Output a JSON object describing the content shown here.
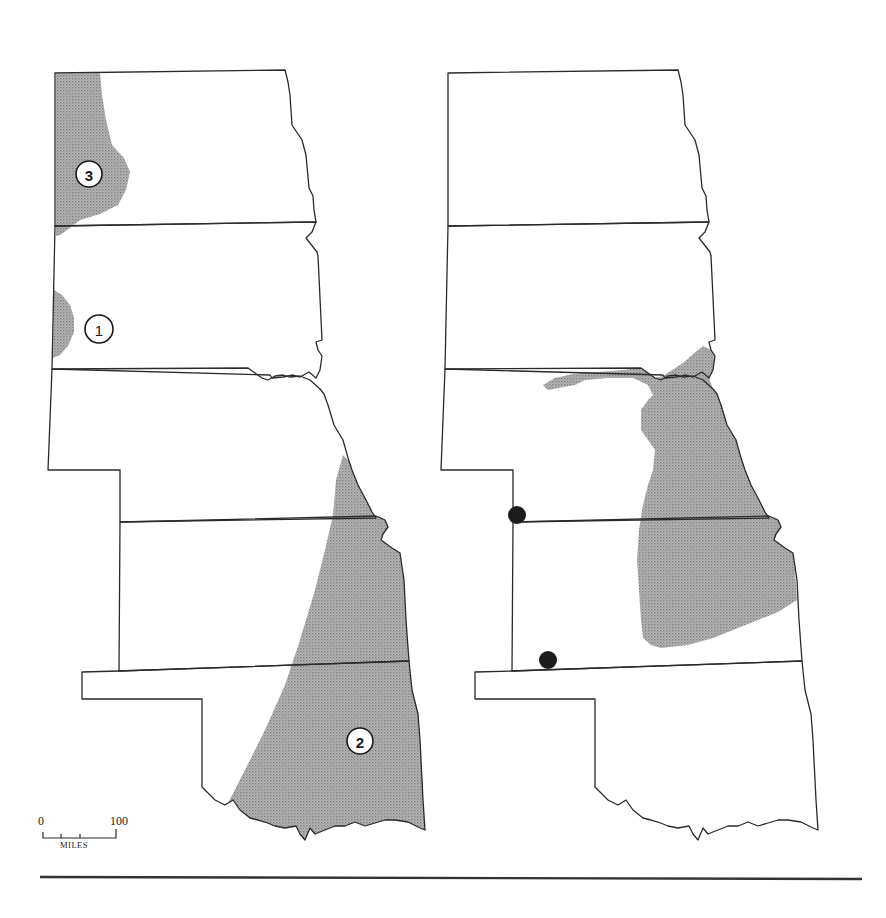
{
  "figure": {
    "type": "distribution-map-pair",
    "region": "Great Plains (North Dakota, South Dakota, Nebraska, Kansas, Oklahoma)",
    "colors": {
      "outline": "#2a2a2a",
      "range_fill": "#a8a8a8",
      "locality_dot": "#1c1c1c",
      "background": "#ffffff"
    }
  },
  "left_map": {
    "states": [
      "North Dakota",
      "South Dakota",
      "Nebraska",
      "Kansas",
      "Oklahoma"
    ],
    "ranges": [
      {
        "id": "1",
        "label": "1",
        "location": "western South Dakota edge"
      },
      {
        "id": "2",
        "label": "2",
        "location": "eastern Nebraska, Kansas and Oklahoma"
      },
      {
        "id": "3",
        "label": "3",
        "location": "western North Dakota"
      }
    ]
  },
  "right_map": {
    "states": [
      "North Dakota",
      "South Dakota",
      "Nebraska",
      "Kansas",
      "Oklahoma"
    ],
    "ranges": [
      {
        "id": "main",
        "location": "southeast South Dakota, eastern Nebraska and eastern Kansas"
      }
    ],
    "locality_dots": [
      {
        "location": "Kansas–Colorado line at Nebraska border"
      },
      {
        "location": "southwest Kansas near Oklahoma border"
      }
    ]
  },
  "scale_bar": {
    "min_label": "0",
    "max_label": "100",
    "units": "MILES"
  }
}
